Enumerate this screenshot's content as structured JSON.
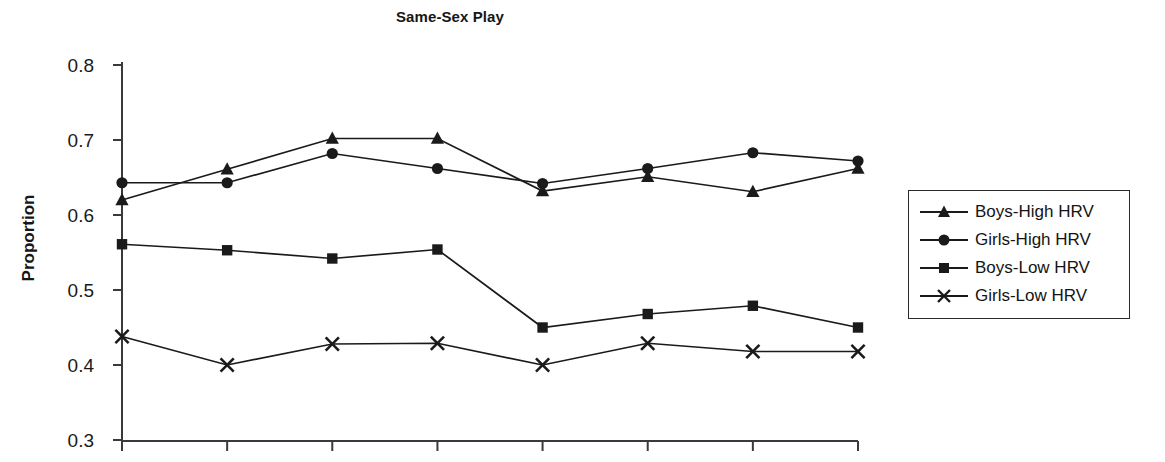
{
  "chart_data": {
    "type": "line",
    "title": "Same-Sex Play",
    "xlabel": "",
    "ylabel": "Proportion",
    "ylim": [
      0.3,
      0.8
    ],
    "ytick_labels": [
      "0.8",
      "0.7",
      "0.6",
      "0.5",
      "0.4",
      "0.3"
    ],
    "yticks": [
      0.8,
      0.7,
      0.6,
      0.5,
      0.4,
      0.3
    ],
    "xtick_labels": [
      "",
      "",
      "",
      "",
      "",
      "",
      "",
      ""
    ],
    "x": [
      1,
      2,
      3,
      4,
      5,
      6,
      7,
      8
    ],
    "grid": false,
    "legend_position": "right-outside",
    "series": [
      {
        "name": "Boys-High HRV",
        "marker": "triangle",
        "values": [
          0.62,
          0.661,
          0.702,
          0.702,
          0.632,
          0.651,
          0.631,
          0.662
        ]
      },
      {
        "name": "Girls-High HRV",
        "marker": "circle",
        "values": [
          0.643,
          0.643,
          0.682,
          0.662,
          0.642,
          0.662,
          0.683,
          0.672
        ]
      },
      {
        "name": "Boys-Low HRV",
        "marker": "square",
        "values": [
          0.561,
          0.553,
          0.542,
          0.554,
          0.45,
          0.468,
          0.479,
          0.45
        ]
      },
      {
        "name": "Girls-Low HRV",
        "marker": "cross",
        "values": [
          0.438,
          0.4,
          0.428,
          0.429,
          0.4,
          0.429,
          0.418,
          0.418
        ]
      }
    ]
  },
  "legend": {
    "items": [
      {
        "label": "Boys-High HRV",
        "marker": "triangle"
      },
      {
        "label": "Girls-High HRV",
        "marker": "circle"
      },
      {
        "label": "Boys-Low HRV",
        "marker": "square"
      },
      {
        "label": "Girls-Low HRV",
        "marker": "cross"
      }
    ]
  },
  "colors": {
    "ink": "#1a1a1a",
    "axis": "#3a3a3a",
    "background": "#ffffff"
  }
}
